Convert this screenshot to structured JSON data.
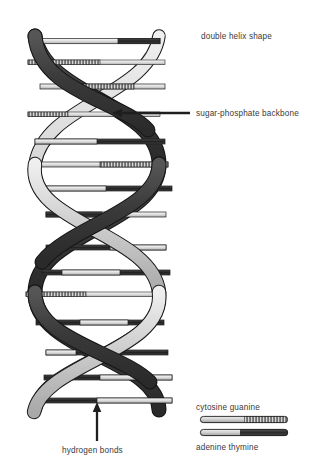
{
  "figure": {
    "background_color": "#ffffff",
    "ink_color": "#2b2b2b"
  },
  "annotations": {
    "double_helix": {
      "text": "double helix shape",
      "has_leader_line": false
    },
    "backbone": {
      "text": "sugar-phosphate backbone",
      "has_leader_line": true,
      "arrow_direction": "left",
      "arrow_from_x": 190,
      "arrow_to_x": 113,
      "arrow_y": 113
    },
    "hydrogen_bonds": {
      "text": "hydrogen bonds",
      "has_leader_line": true,
      "arrow_direction": "up",
      "arrow_x": 97,
      "arrow_from_y": 441,
      "arrow_to_y": 403
    }
  },
  "legend": {
    "name": "base-pair-legend",
    "entries": [
      {
        "id": "cytosine-guanine",
        "caption": "cytosine  guanine",
        "left_base": "cytosine",
        "right_base": "guanine",
        "left_color": "#b3b3b3",
        "right_color": "#3a3a3a",
        "pattern": "hatched",
        "caption_position": "above"
      },
      {
        "id": "adenine-thymine",
        "caption": "adenine  thymine",
        "left_base": "adenine",
        "right_base": "thymine",
        "left_color": "#c4c4c4",
        "right_color": "#2f2f2f",
        "pattern": "solid",
        "caption_position": "below"
      }
    ]
  },
  "helix": {
    "name": "dna-double-helix",
    "strand_dark_color": "#3d3d3d",
    "strand_light_color": "#c9c9c9",
    "outline_color": "#1a1a1a",
    "rung_dark_color": "#2b2b2b",
    "rung_light_color": "#d8d8d8",
    "turns": 3.5,
    "rung_count": 18,
    "center_x": 97,
    "top_y": 28,
    "bottom_y": 410,
    "amplitude": 62,
    "description": "Two antiparallel sugar-phosphate ribbons twisting around a common axis, connected by horizontal base-pair rungs."
  }
}
